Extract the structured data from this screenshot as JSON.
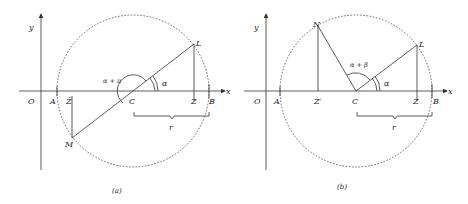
{
  "panels": [
    {
      "id": "a",
      "caption": "(a)",
      "axis_x_label": "x",
      "axis_y_label": "y",
      "origin_label": "O",
      "points": {
        "A": "A",
        "Zbar": "Z̄",
        "C": "C",
        "Z": "Z",
        "B": "B",
        "L": "L",
        "M": "M"
      },
      "angles": {
        "alpha": "α",
        "outer": "α + π"
      },
      "radius_label": "r"
    },
    {
      "id": "b",
      "caption": "(b)",
      "axis_x_label": "x",
      "axis_y_label": "y",
      "origin_label": "O",
      "points": {
        "A": "A",
        "Zprime": "Z′",
        "C": "C",
        "Z": "Z",
        "B": "B",
        "L": "L",
        "N": "N"
      },
      "angles": {
        "alpha": "α",
        "outer": "α + β"
      },
      "radius_label": "r"
    }
  ]
}
